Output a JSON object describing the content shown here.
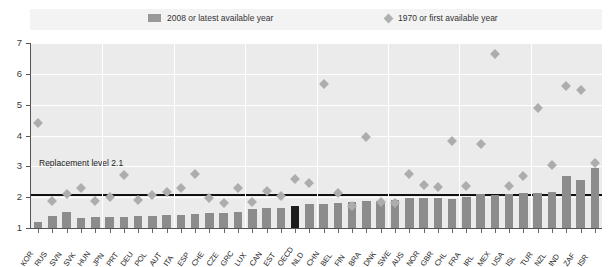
{
  "legend": {
    "bar_label": "2008 or latest available year",
    "diamond_label": "1970 or first available year",
    "bar_icon": "square-swatch-icon",
    "diamond_icon": "diamond-swatch-icon"
  },
  "annotation": {
    "replacement_level_label": "Replacement level 2.1",
    "replacement_level_value": 2.1
  },
  "colors": {
    "bar": "#8c8c8c",
    "bar_highlight": "#1c1c1c",
    "diamond": "#adadad",
    "plot_background": "#ebebeb",
    "gridline": "#ffffff",
    "axis": "#555555",
    "replacement_line": "#111111",
    "legend_background": "#f3f3f3"
  },
  "chart_data": {
    "type": "bar",
    "title": "",
    "subtitle": "",
    "xlabel": "",
    "ylabel": "",
    "ylim": [
      1,
      7
    ],
    "yticks": [
      1,
      2,
      3,
      4,
      5,
      6,
      7
    ],
    "grid": true,
    "legend_position": "top",
    "highlight_category": "OECD",
    "categories": [
      "KOR",
      "RUS",
      "SVN",
      "SVK",
      "HUN",
      "JPN",
      "PRT",
      "DEU",
      "POL",
      "AUT",
      "ITA",
      "ESP",
      "CHE",
      "CZE",
      "GRC",
      "LUX",
      "CAN",
      "EST",
      "OECD",
      "NLD",
      "CHN",
      "BEL",
      "FIN",
      "BRA",
      "DNK",
      "SWE",
      "AUS",
      "NOR",
      "GBR",
      "CHL",
      "FRA",
      "IRL",
      "MEX",
      "USA",
      "ISL",
      "TUR",
      "NZL",
      "IND",
      "ZAF",
      "ISR"
    ],
    "series": [
      {
        "name": "2008 or latest available year",
        "type": "bar",
        "values": [
          1.19,
          1.39,
          1.53,
          1.32,
          1.35,
          1.37,
          1.37,
          1.38,
          1.39,
          1.41,
          1.41,
          1.46,
          1.48,
          1.5,
          1.51,
          1.61,
          1.66,
          1.65,
          1.71,
          1.77,
          1.77,
          1.82,
          1.85,
          1.86,
          1.89,
          1.91,
          1.97,
          1.96,
          1.96,
          1.94,
          2.0,
          2.1,
          2.08,
          2.1,
          2.14,
          2.15,
          2.18,
          2.68,
          2.55,
          2.96
        ]
      },
      {
        "name": "1970 or first available year",
        "type": "scatter",
        "values": [
          4.53,
          2.0,
          2.21,
          2.41,
          1.98,
          2.13,
          2.83,
          2.03,
          2.2,
          2.29,
          2.42,
          2.88,
          2.1,
          1.92,
          2.4,
          1.97,
          2.33,
          2.16,
          2.7,
          2.57,
          5.77,
          2.25,
          1.83,
          4.06,
          1.95,
          1.92,
          2.86,
          2.5,
          2.43,
          3.95,
          2.47,
          3.85,
          6.76,
          2.48,
          2.81,
          5.0,
          3.17,
          5.72,
          5.6,
          3.23
        ]
      }
    ]
  }
}
